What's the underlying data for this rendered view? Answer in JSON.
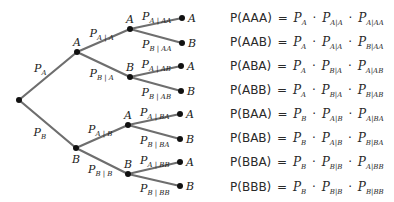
{
  "diagram": {
    "type": "probability-tree",
    "root": {
      "x": 19,
      "y": 100
    },
    "level1": [
      {
        "id": "A",
        "label": "A",
        "x": 77,
        "y": 52,
        "branch_label": "P",
        "branch_sub": "A"
      },
      {
        "id": "B",
        "label": "B",
        "x": 76,
        "y": 148,
        "branch_label": "P",
        "branch_sub": "B"
      }
    ],
    "level2": [
      {
        "id": "AA",
        "parent": "A",
        "label": "A",
        "x": 130,
        "y": 29,
        "branch_label": "P",
        "branch_sub": "A | A"
      },
      {
        "id": "AB",
        "parent": "A",
        "label": "B",
        "x": 130,
        "y": 77,
        "branch_label": "P",
        "branch_sub": "B | A"
      },
      {
        "id": "BA",
        "parent": "B",
        "label": "A",
        "x": 128,
        "y": 125,
        "branch_label": "P",
        "branch_sub": "A | B"
      },
      {
        "id": "BB",
        "parent": "B",
        "label": "B",
        "x": 128,
        "y": 174,
        "branch_label": "P",
        "branch_sub": "B | B"
      }
    ],
    "leaves": [
      {
        "id": "AAA",
        "parent": "AA",
        "label": "A",
        "x": 182,
        "y": 18,
        "branch_label": "P",
        "branch_sub": "A | AA"
      },
      {
        "id": "AAB",
        "parent": "AA",
        "label": "B",
        "x": 182,
        "y": 43,
        "branch_label": "P",
        "branch_sub": "B | AA"
      },
      {
        "id": "ABA",
        "parent": "AB",
        "label": "A",
        "x": 181,
        "y": 66,
        "branch_label": "P",
        "branch_sub": "A | AB"
      },
      {
        "id": "ABB",
        "parent": "AB",
        "label": "B",
        "x": 181,
        "y": 91,
        "branch_label": "P",
        "branch_sub": "B | AB"
      },
      {
        "id": "BAA",
        "parent": "BA",
        "label": "A",
        "x": 180,
        "y": 114,
        "branch_label": "P",
        "branch_sub": "A | BA"
      },
      {
        "id": "BAB",
        "parent": "BA",
        "label": "B",
        "x": 180,
        "y": 139,
        "branch_label": "P",
        "branch_sub": "B | BA"
      },
      {
        "id": "BBA",
        "parent": "BB",
        "label": "A",
        "x": 180,
        "y": 162,
        "branch_label": "P",
        "branch_sub": "A | BB"
      },
      {
        "id": "BBB",
        "parent": "BB",
        "label": "B",
        "x": 180,
        "y": 186,
        "branch_label": "P",
        "branch_sub": "B | BB"
      }
    ],
    "colors": {
      "branch": "#6e6e6e",
      "node": "#111111",
      "text": "#1a1a1a"
    }
  },
  "equations": [
    {
      "lhs": "P(AAA)",
      "eq": "=",
      "terms": [
        {
          "p": "P",
          "sub": "A"
        },
        {
          "p": "P",
          "sub": "A|A"
        },
        {
          "p": "P",
          "sub": "A|AA"
        }
      ]
    },
    {
      "lhs": "P(AAB)",
      "eq": "=",
      "terms": [
        {
          "p": "P",
          "sub": "A"
        },
        {
          "p": "P",
          "sub": "A|A"
        },
        {
          "p": "P",
          "sub": "B|AA"
        }
      ]
    },
    {
      "lhs": "P(ABA)",
      "eq": "=",
      "terms": [
        {
          "p": "P",
          "sub": "A"
        },
        {
          "p": "P",
          "sub": "B|A"
        },
        {
          "p": "P",
          "sub": "A|AB"
        }
      ]
    },
    {
      "lhs": "P(ABB)",
      "eq": "=",
      "terms": [
        {
          "p": "P",
          "sub": "A"
        },
        {
          "p": "P",
          "sub": "B|A"
        },
        {
          "p": "P",
          "sub": "B|AB"
        }
      ]
    },
    {
      "lhs": "P(BAA)",
      "eq": "=",
      "terms": [
        {
          "p": "P",
          "sub": "B"
        },
        {
          "p": "P",
          "sub": "A|B"
        },
        {
          "p": "P",
          "sub": "A|BA"
        }
      ]
    },
    {
      "lhs": "P(BAB)",
      "eq": "=",
      "terms": [
        {
          "p": "P",
          "sub": "B"
        },
        {
          "p": "P",
          "sub": "A|B"
        },
        {
          "p": "P",
          "sub": "B|BA"
        }
      ]
    },
    {
      "lhs": "P(BBA)",
      "eq": "=",
      "terms": [
        {
          "p": "P",
          "sub": "B"
        },
        {
          "p": "P",
          "sub": "B|B"
        },
        {
          "p": "P",
          "sub": "A|BB"
        }
      ]
    },
    {
      "lhs": "P(BBB)",
      "eq": "=",
      "terms": [
        {
          "p": "P",
          "sub": "B"
        },
        {
          "p": "P",
          "sub": "B|B"
        },
        {
          "p": "P",
          "sub": "B|BB"
        }
      ]
    }
  ],
  "equation_rows_y": [
    11,
    35,
    59,
    83,
    107,
    131,
    155,
    180
  ],
  "dot_operator": "·"
}
